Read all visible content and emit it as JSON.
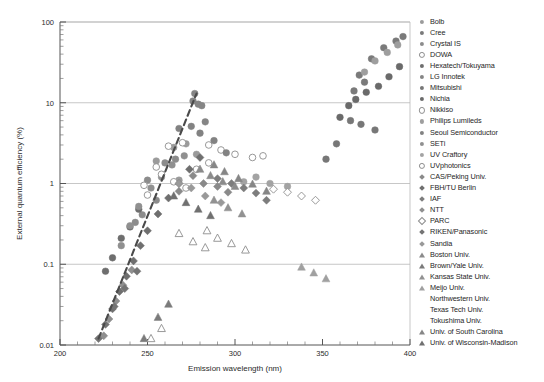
{
  "chart_data": {
    "type": "scatter",
    "title": "",
    "xlabel": "Emission wavelength (nm)",
    "ylabel": "External quantum efficiency (%)",
    "xlim": [
      200,
      400
    ],
    "ylim": [
      0.01,
      100
    ],
    "yscale": "log",
    "xticks": [
      200,
      250,
      300,
      350,
      400
    ],
    "ytick_labels": [
      "100",
      "10",
      "1",
      "0.1",
      "0.01"
    ],
    "ytick_values": [
      100,
      10,
      1,
      0.1,
      0.01
    ],
    "grid": "horizontal-major",
    "legend_position": "right-outside",
    "annotations": [
      {
        "name": "trend-line",
        "style": "dashed",
        "x": [
          222,
          278
        ],
        "y": [
          0.012,
          13.0
        ]
      }
    ],
    "series": [
      {
        "name": "Bolb",
        "marker": "circle",
        "color": "#9b9b9b",
        "points": [
          [
            265,
            2.8
          ],
          [
            272,
            3.1
          ],
          [
            278,
            2.3
          ],
          [
            255,
            1.9
          ],
          [
            268,
            1.1
          ]
        ]
      },
      {
        "name": "Cree",
        "marker": "circle",
        "color": "#7a7a7a",
        "points": [
          [
            371,
            22
          ],
          [
            378,
            35
          ],
          [
            385,
            48
          ],
          [
            392,
            58
          ],
          [
            396,
            66
          ],
          [
            368,
            14
          ],
          [
            374,
            18
          ]
        ]
      },
      {
        "name": "Crystal IS",
        "marker": "circle",
        "color": "#8c8c8c",
        "points": [
          [
            250,
            1.1
          ],
          [
            255,
            0.62
          ],
          [
            260,
            1.8
          ],
          [
            247,
            0.41
          ],
          [
            243,
            0.33
          ],
          [
            266,
            2.0
          ]
        ]
      },
      {
        "name": "DOWA",
        "marker": "circle-open",
        "color": "#cfcfcf",
        "points": [
          [
            285,
            1.8
          ],
          [
            292,
            2.6
          ],
          [
            300,
            2.3
          ],
          [
            310,
            2.1
          ],
          [
            316,
            2.2
          ],
          [
            278,
            1.5
          ]
        ]
      },
      {
        "name": "Hexatech/Tokuyama",
        "marker": "circle",
        "color": "#6e6e6e",
        "points": [
          [
            226,
            0.082
          ],
          [
            230,
            0.12
          ],
          [
            235,
            0.21
          ],
          [
            240,
            0.29
          ],
          [
            245,
            0.48
          ]
        ]
      },
      {
        "name": "LG Innotek",
        "marker": "circle",
        "color": "#858585",
        "points": [
          [
            277,
            13
          ],
          [
            279,
            9.6
          ],
          [
            281,
            9.2
          ],
          [
            276,
            10.5
          ],
          [
            283,
            5.8
          ]
        ]
      },
      {
        "name": "Mitsubishi",
        "marker": "circle",
        "color": "#777777",
        "points": [
          [
            366,
            6.0
          ],
          [
            372,
            5.4
          ],
          [
            380,
            4.6
          ],
          [
            358,
            3.1
          ],
          [
            352,
            2.0
          ]
        ]
      },
      {
        "name": "Nichia",
        "marker": "circle",
        "color": "#6a6a6a",
        "points": [
          [
            365,
            9.2
          ],
          [
            369,
            11.0
          ],
          [
            375,
            13.5
          ],
          [
            382,
            16.0
          ],
          [
            388,
            21.0
          ],
          [
            394,
            28.0
          ],
          [
            360,
            6.6
          ]
        ]
      },
      {
        "name": "Nikkiso",
        "marker": "circle-open",
        "color": "#d6d6d6",
        "points": [
          [
            262,
            2.9
          ],
          [
            270,
            3.2
          ],
          [
            285,
            3.0
          ],
          [
            255,
            1.6
          ],
          [
            248,
            0.95
          ]
        ]
      },
      {
        "name": "Philips Lumileds",
        "marker": "circle",
        "color": "#9e9e9e",
        "points": [
          [
            380,
            33
          ],
          [
            387,
            42
          ],
          [
            393,
            52
          ],
          [
            374,
            24
          ]
        ]
      },
      {
        "name": "Seoul Semiconductor",
        "marker": "circle",
        "color": "#828282",
        "points": [
          [
            275,
            5.1
          ],
          [
            280,
            4.2
          ],
          [
            288,
            3.4
          ],
          [
            295,
            2.4
          ],
          [
            268,
            4.8
          ]
        ]
      },
      {
        "name": "SETi",
        "marker": "circle",
        "color": "#909090",
        "points": [
          [
            245,
            0.52
          ],
          [
            252,
            0.88
          ],
          [
            258,
            1.2
          ],
          [
            264,
            1.7
          ],
          [
            271,
            2.2
          ],
          [
            240,
            0.3
          ],
          [
            235,
            0.17
          ]
        ]
      },
      {
        "name": "UV Craftory",
        "marker": "circle",
        "color": "#a3a3a3",
        "points": [
          [
            305,
            1.05
          ],
          [
            312,
            1.2
          ],
          [
            320,
            1.0
          ],
          [
            330,
            0.92
          ]
        ]
      },
      {
        "name": "UVphotonics",
        "marker": "circle-open",
        "color": "#e0e0e0",
        "points": [
          [
            258,
            1.3
          ],
          [
            265,
            1.05
          ],
          [
            272,
            0.88
          ],
          [
            250,
            0.72
          ]
        ]
      },
      {
        "name": "CAS/Peking Univ.",
        "marker": "diamond",
        "color": "#8a8a8a",
        "points": [
          [
            282,
            1.0
          ],
          [
            290,
            0.92
          ],
          [
            296,
            0.78
          ],
          [
            276,
            1.25
          ],
          [
            268,
            0.8
          ]
        ]
      },
      {
        "name": "FBH/TU Berlin",
        "marker": "diamond",
        "color": "#6f6f6f",
        "points": [
          [
            230,
            0.028
          ],
          [
            234,
            0.046
          ],
          [
            238,
            0.071
          ],
          [
            242,
            0.11
          ],
          [
            246,
            0.17
          ],
          [
            250,
            0.26
          ],
          [
            256,
            0.42
          ],
          [
            262,
            0.66
          ],
          [
            268,
            1.0
          ],
          [
            274,
            1.5
          ],
          [
            280,
            2.1
          ]
        ]
      },
      {
        "name": "IAF",
        "marker": "diamond",
        "color": "#7d7d7d",
        "points": [
          [
            298,
            1.0
          ],
          [
            305,
            0.88
          ],
          [
            312,
            0.76
          ],
          [
            290,
            1.15
          ],
          [
            318,
            0.62
          ]
        ]
      },
      {
        "name": "NTT",
        "marker": "diamond",
        "color": "#8f8f8f",
        "points": [
          [
            225,
            0.013
          ],
          [
            228,
            0.021
          ],
          [
            232,
            0.035
          ],
          [
            236,
            0.055
          ],
          [
            241,
            0.085
          ]
        ]
      },
      {
        "name": "PARC",
        "marker": "diamond-open",
        "color": "#dcdcdc",
        "points": [
          [
            330,
            0.78
          ],
          [
            338,
            0.7
          ],
          [
            346,
            0.62
          ],
          [
            322,
            0.85
          ]
        ]
      },
      {
        "name": "RIKEN/Panasonic",
        "marker": "diamond",
        "color": "#747474",
        "points": [
          [
            222,
            0.012
          ],
          [
            226,
            0.018
          ],
          [
            231,
            0.03
          ],
          [
            237,
            0.05
          ],
          [
            244,
            0.082
          ]
        ]
      },
      {
        "name": "Sandia",
        "marker": "diamond",
        "color": "#999999",
        "points": [
          [
            275,
            0.88
          ],
          [
            283,
            0.7
          ],
          [
            292,
            0.58
          ],
          [
            268,
            1.0
          ]
        ]
      },
      {
        "name": "Boston Univ.",
        "marker": "triangle",
        "color": "#8b8b8b",
        "points": [
          [
            286,
            1.25
          ],
          [
            293,
            1.05
          ],
          [
            300,
            0.92
          ],
          [
            280,
            1.5
          ]
        ]
      },
      {
        "name": "Brown/Yale Univ.",
        "marker": "triangle",
        "color": "#7b7b7b",
        "points": [
          [
            248,
            0.012
          ],
          [
            256,
            0.022
          ],
          [
            262,
            0.032
          ]
        ]
      },
      {
        "name": "Kansas State Univ.",
        "marker": "triangle",
        "color": "#929292",
        "points": [
          [
            288,
            0.62
          ],
          [
            296,
            0.5
          ],
          [
            304,
            0.42
          ]
        ]
      },
      {
        "name": "Meijo Univ.",
        "marker": "triangle",
        "color": "#a0a0a0",
        "points": [
          [
            338,
            0.092
          ],
          [
            345,
            0.078
          ],
          [
            352,
            0.066
          ]
        ]
      },
      {
        "name": "Northwestern Univ.",
        "marker": "triangle-open",
        "color": "#d2d2d2",
        "points": [
          [
            290,
            0.21
          ],
          [
            298,
            0.18
          ],
          [
            306,
            0.15
          ],
          [
            284,
            0.26
          ]
        ]
      },
      {
        "name": "Texas Tech Univ.",
        "marker": "triangle-open",
        "color": "#dadada",
        "points": [
          [
            276,
            0.19
          ],
          [
            283,
            0.16
          ],
          [
            268,
            0.24
          ]
        ]
      },
      {
        "name": "Tokushima Univ.",
        "marker": "triangle-open",
        "color": "#e2e2e2",
        "points": [
          [
            252,
            0.012
          ],
          [
            258,
            0.016
          ]
        ]
      },
      {
        "name": "Univ. of South Carolina",
        "marker": "triangle",
        "color": "#868686",
        "points": [
          [
            294,
            1.4
          ],
          [
            302,
            1.15
          ],
          [
            310,
            0.98
          ],
          [
            288,
            1.7
          ],
          [
            318,
            0.8
          ]
        ]
      },
      {
        "name": "Univ. of Wisconsin-Madison",
        "marker": "triangle",
        "color": "#707070",
        "points": [
          [
            272,
            0.58
          ],
          [
            279,
            0.48
          ],
          [
            286,
            0.4
          ],
          [
            265,
            0.7
          ]
        ]
      }
    ]
  },
  "legend": {
    "items": [
      {
        "label": "Bolb"
      },
      {
        "label": "Cree"
      },
      {
        "label": "Crystal IS"
      },
      {
        "label": "DOWA"
      },
      {
        "label": "Hexatech/Tokuyama"
      },
      {
        "label": "LG Innotek"
      },
      {
        "label": "Mitsubishi"
      },
      {
        "label": "Nichia"
      },
      {
        "label": "Nikkiso"
      },
      {
        "label": "Philips Lumileds"
      },
      {
        "label": "Seoul Semiconductor"
      },
      {
        "label": "SETi"
      },
      {
        "label": "UV Craftory"
      },
      {
        "label": "UVphotonics"
      },
      {
        "label": "CAS/Peking Univ."
      },
      {
        "label": "FBH/TU Berlin"
      },
      {
        "label": "IAF"
      },
      {
        "label": "NTT"
      },
      {
        "label": "PARC"
      },
      {
        "label": "RIKEN/Panasonic"
      },
      {
        "label": "Sandia"
      },
      {
        "label": "Boston Univ."
      },
      {
        "label": "Brown/Yale Univ."
      },
      {
        "label": "Kansas State Univ."
      },
      {
        "label": "Meijo Univ."
      },
      {
        "label": "Northwestern Univ."
      },
      {
        "label": "Texas Tech Univ."
      },
      {
        "label": "Tokushima Univ."
      },
      {
        "label": "Univ. of South Carolina"
      },
      {
        "label": "Univ. of Wisconsin-Madison"
      }
    ]
  },
  "colors": {
    "axis": "#555555",
    "grid": "#b9b9b9",
    "trend": "#4a4a4a",
    "background": "#ffffff"
  }
}
